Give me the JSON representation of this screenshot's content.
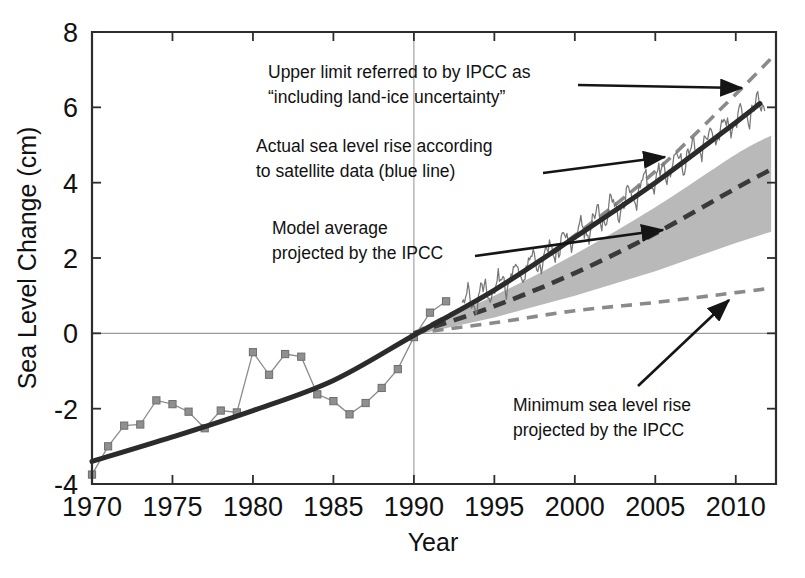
{
  "chart_data": {
    "type": "line",
    "title": "",
    "xlabel": "Year",
    "ylabel": "Sea Level Change (cm)",
    "xlim": [
      1970,
      2012.5
    ],
    "ylim": [
      -4,
      8
    ],
    "xticks": [
      1970,
      1975,
      1980,
      1985,
      1990,
      1995,
      2000,
      2005,
      2010
    ],
    "xtick_labels": [
      "1970",
      "1975",
      "1980",
      "1985",
      "1990",
      "1995",
      "2000",
      "2005",
      "2010"
    ],
    "yticks": [
      -4,
      -2,
      0,
      2,
      4,
      6,
      8
    ],
    "ytick_labels": [
      "-4",
      "-2",
      "0",
      "2",
      "4",
      "6",
      "8"
    ],
    "grid": false,
    "legend_position": "none",
    "reference_lines": [
      {
        "name": "zero-line",
        "orientation": "horizontal",
        "value": 0,
        "color": "#9a9a9a"
      },
      {
        "name": "baseline-1990",
        "orientation": "vertical",
        "value": 1990,
        "color": "#9a9a9a"
      }
    ],
    "series": [
      {
        "name": "Tide gauge observations (markers)",
        "style": "line-with-square-markers",
        "color": "#8c8c8c",
        "x": [
          1970,
          1971,
          1972,
          1973,
          1974,
          1975,
          1976,
          1977,
          1978,
          1979,
          1980,
          1981,
          1982,
          1983,
          1984,
          1985,
          1986,
          1987,
          1988,
          1989,
          1990,
          1991,
          1992
        ],
        "values": [
          -3.75,
          -3.0,
          -2.45,
          -2.42,
          -1.78,
          -1.88,
          -2.08,
          -2.52,
          -2.05,
          -2.1,
          -0.5,
          -1.1,
          -0.55,
          -0.62,
          -1.62,
          -1.8,
          -2.15,
          -1.85,
          -1.45,
          -0.95,
          -0.1,
          0.55,
          0.85
        ]
      },
      {
        "name": "Smoothed observed sea level (thick solid)",
        "style": "solid-thick",
        "color": "#2b2b2b",
        "x": [
          1970,
          1975,
          1980,
          1985,
          1990,
          1995,
          2000,
          2005,
          2010,
          2011.5
        ],
        "values": [
          -3.4,
          -2.75,
          -2.05,
          -1.25,
          -0.05,
          1.15,
          2.55,
          4.0,
          5.6,
          6.1
        ]
      },
      {
        "name": "Satellite altimetry (noisy blue line)",
        "style": "solid-thin-noisy",
        "color": "#777777",
        "x": [
          1993,
          1995,
          1997,
          1999,
          2001,
          2003,
          2005,
          2007,
          2009,
          2011,
          2011.8
        ],
        "values": [
          0.75,
          1.2,
          1.75,
          2.3,
          2.9,
          3.5,
          4.1,
          4.75,
          5.35,
          5.95,
          6.2
        ]
      },
      {
        "name": "Upper limit referred to by IPCC as including land-ice uncertainty",
        "style": "dashed",
        "color": "#8a8a8a",
        "x": [
          1990,
          1995,
          2000,
          2005,
          2010,
          2012.2
        ],
        "values": [
          0.0,
          1.15,
          2.6,
          4.3,
          6.35,
          7.3
        ]
      },
      {
        "name": "Model average projected by the IPCC",
        "style": "dashed-thick",
        "color": "#3a3a3a",
        "x": [
          1990,
          1995,
          2000,
          2005,
          2010,
          2012.2
        ],
        "values": [
          0.0,
          0.72,
          1.6,
          2.65,
          3.85,
          4.35
        ]
      },
      {
        "name": "Projection uncertainty band upper",
        "style": "band-edge",
        "color": "#b8b8b8",
        "x": [
          1990,
          1995,
          2000,
          2005,
          2010,
          2012.2
        ],
        "values": [
          0.05,
          1.0,
          2.1,
          3.35,
          4.75,
          5.25
        ]
      },
      {
        "name": "Projection uncertainty band lower",
        "style": "band-edge",
        "color": "#b8b8b8",
        "x": [
          1990,
          1995,
          2000,
          2005,
          2010,
          2012.2
        ],
        "values": [
          -0.05,
          0.42,
          1.0,
          1.65,
          2.4,
          2.7
        ]
      },
      {
        "name": "Minimum sea level rise projected by the IPCC",
        "style": "dashed",
        "color": "#8a8a8a",
        "x": [
          1990,
          1995,
          2000,
          2005,
          2010,
          2012.2
        ],
        "values": [
          0.0,
          0.28,
          0.6,
          0.82,
          1.08,
          1.2
        ]
      }
    ],
    "shaded_regions": [
      {
        "name": "ipcc-projection-range",
        "color": "#b9b9b9",
        "opacity": 1,
        "description": "Gray band spanning IPCC projected range from 1990 to 2012"
      }
    ],
    "annotations": [
      {
        "id": "upper-limit",
        "lines": [
          "Upper limit referred to by IPCC as",
          "“including land-ice uncertainty”"
        ],
        "text_x": 268,
        "text_y": 78,
        "arrow": {
          "x1": 578,
          "y1": 85,
          "x2": 742,
          "y2": 88
        }
      },
      {
        "id": "actual-rise",
        "lines": [
          "Actual sea level rise according",
          "to satellite data (blue line)"
        ],
        "text_x": 256,
        "text_y": 152,
        "arrow": {
          "x1": 543,
          "y1": 173,
          "x2": 665,
          "y2": 157
        }
      },
      {
        "id": "model-average",
        "lines": [
          "Model average",
          "projected by the IPCC"
        ],
        "text_x": 272,
        "text_y": 234,
        "arrow": {
          "x1": 475,
          "y1": 256,
          "x2": 663,
          "y2": 230
        }
      },
      {
        "id": "minimum-rise",
        "lines": [
          "Minimum sea level rise",
          "projected by the IPCC"
        ],
        "text_x": 513,
        "text_y": 411,
        "arrow": {
          "x1": 638,
          "y1": 386,
          "x2": 729,
          "y2": 300
        }
      }
    ]
  },
  "axes": {
    "x_title": "Year",
    "y_title": "Sea Level Change (cm)"
  }
}
